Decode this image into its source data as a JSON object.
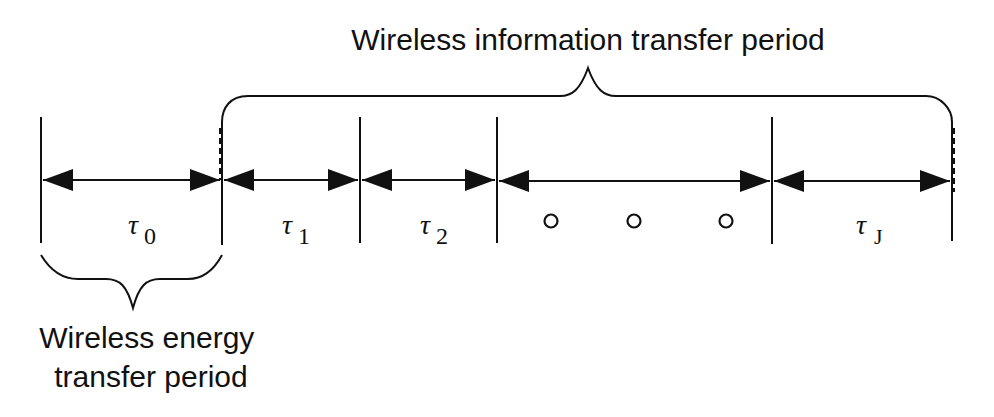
{
  "title": "Wireless information transfer period",
  "bottom_label": {
    "line1": "Wireless energy",
    "line2": "transfer period"
  },
  "segments": [
    {
      "symbol": "τ",
      "subscript": "0"
    },
    {
      "symbol": "τ",
      "subscript": "1"
    },
    {
      "symbol": "τ",
      "subscript": "2"
    },
    {
      "symbol": "ellipsis",
      "subscript": ""
    },
    {
      "symbol": "τ",
      "subscript": "J"
    }
  ],
  "ellipsis_marks": [
    "o",
    "o",
    "o"
  ],
  "colors": {
    "line": "#111111",
    "background": "#ffffff"
  }
}
